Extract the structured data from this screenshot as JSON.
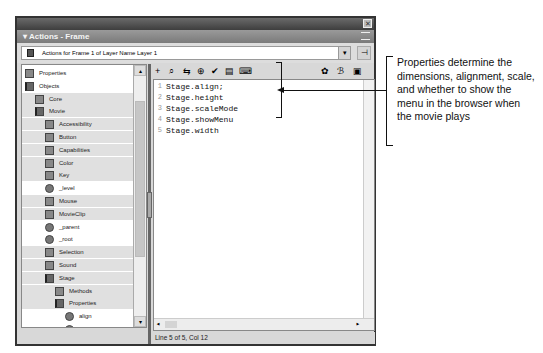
{
  "panel": {
    "title": "▾ Actions - Frame",
    "close_icon": "✕",
    "target_label": "Actions for Frame 1 of Layer Name Layer 1",
    "dropdown_glyph": "▾",
    "pin_glyph": "⊣"
  },
  "toolbox": {
    "items": [
      {
        "label": "Properties",
        "indent": 0,
        "icon": "book-closed",
        "shaded": false
      },
      {
        "label": "Objects",
        "indent": 0,
        "icon": "book-open",
        "shaded": false
      },
      {
        "label": "Core",
        "indent": 1,
        "icon": "book-closed",
        "shaded": true
      },
      {
        "label": "Movie",
        "indent": 1,
        "icon": "book-open",
        "shaded": true
      },
      {
        "label": "Accessibility",
        "indent": 2,
        "icon": "book-closed",
        "shaded": true
      },
      {
        "label": "Button",
        "indent": 2,
        "icon": "book-closed",
        "shaded": true
      },
      {
        "label": "Capabilities",
        "indent": 2,
        "icon": "book-closed",
        "shaded": true
      },
      {
        "label": "Color",
        "indent": 2,
        "icon": "book-closed",
        "shaded": true
      },
      {
        "label": "Key",
        "indent": 2,
        "icon": "book-closed",
        "shaded": true
      },
      {
        "label": "_level",
        "indent": 2,
        "icon": "circle",
        "shaded": false
      },
      {
        "label": "Mouse",
        "indent": 2,
        "icon": "book-closed",
        "shaded": true
      },
      {
        "label": "MovieClip",
        "indent": 2,
        "icon": "book-closed",
        "shaded": true
      },
      {
        "label": "_parent",
        "indent": 2,
        "icon": "circle",
        "shaded": false
      },
      {
        "label": "_root",
        "indent": 2,
        "icon": "circle",
        "shaded": false
      },
      {
        "label": "Selection",
        "indent": 2,
        "icon": "book-closed",
        "shaded": true
      },
      {
        "label": "Sound",
        "indent": 2,
        "icon": "book-closed",
        "shaded": true
      },
      {
        "label": "Stage",
        "indent": 2,
        "icon": "book-open",
        "shaded": true
      },
      {
        "label": "Methods",
        "indent": 3,
        "icon": "book-closed",
        "shaded": true
      },
      {
        "label": "Properties",
        "indent": 3,
        "icon": "book-open",
        "shaded": true
      },
      {
        "label": "align",
        "indent": 4,
        "icon": "circle",
        "shaded": false
      },
      {
        "label": "height",
        "indent": 4,
        "icon": "circle",
        "shaded": false
      },
      {
        "label": "scaleMode",
        "indent": 4,
        "icon": "circle",
        "shaded": false
      },
      {
        "label": "showMenu",
        "indent": 4,
        "icon": "circle",
        "shaded": false
      },
      {
        "label": "width",
        "indent": 4,
        "icon": "circle",
        "shaded": false
      },
      {
        "label": "Events",
        "indent": 3,
        "icon": "book-closed",
        "shaded": true
      }
    ],
    "scroll_up": "▴",
    "scroll_down": "▾"
  },
  "editor_toolbar": {
    "left": [
      {
        "name": "add-statement",
        "glyph": "+"
      },
      {
        "name": "find",
        "glyph": "⌕"
      },
      {
        "name": "replace",
        "glyph": "⇆"
      },
      {
        "name": "target-path",
        "glyph": "⊕"
      },
      {
        "name": "check-syntax",
        "glyph": "✔"
      },
      {
        "name": "auto-format",
        "glyph": "▤"
      },
      {
        "name": "code-hint",
        "glyph": "⌨"
      }
    ],
    "right": [
      {
        "name": "debug-options",
        "glyph": "✿"
      },
      {
        "name": "view-options",
        "glyph": "ℬ"
      },
      {
        "name": "reference",
        "glyph": "▣"
      }
    ]
  },
  "editor": {
    "lines": [
      {
        "num": "1",
        "code": "Stage.align;"
      },
      {
        "num": "2",
        "code": "Stage.height"
      },
      {
        "num": "3",
        "code": "Stage.scaleMode"
      },
      {
        "num": "4",
        "code": "Stage.showMenu"
      },
      {
        "num": "5",
        "code": "Stage.width"
      }
    ],
    "hscroll_left": "◂",
    "hscroll_right": "▸"
  },
  "status": "Line 5 of 5, Col 12",
  "callout": {
    "text": "Properties determine the dimensions, alignment, scale, and whether to show the menu in the browser when the movie plays"
  }
}
